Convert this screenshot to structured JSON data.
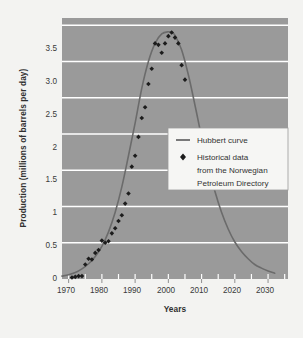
{
  "chart_data": {
    "type": "line",
    "title": "",
    "xlabel": "Years",
    "ylabel": "Production (millions of barrels per day)",
    "xlim": [
      1968,
      2036
    ],
    "ylim": [
      0,
      3.6
    ],
    "grid": true,
    "grid_color": "#ffffff",
    "plot_background": "#9a9a9a",
    "legend_position": "center-right",
    "xticks": [
      "1970",
      "1980",
      "1990",
      "2000",
      "2010",
      "2020",
      "2030"
    ],
    "xtick_values": [
      1970,
      1980,
      1990,
      2000,
      2010,
      2020,
      2030
    ],
    "xminor_step": 5,
    "yticks": [
      "0",
      "0.5",
      "1",
      "1.5",
      "2",
      "2.5",
      "3.0",
      "3.5"
    ],
    "ytick_values": [
      0,
      0.5,
      1,
      1.5,
      2,
      2.5,
      3.0,
      3.5
    ],
    "series": [
      {
        "name": "Hubbert curve",
        "type": "line",
        "color": "#6b6b6b",
        "x": [
          1968,
          1970,
          1972,
          1974,
          1976,
          1978,
          1980,
          1982,
          1984,
          1986,
          1988,
          1990,
          1992,
          1994,
          1996,
          1998,
          2000,
          2001,
          2002,
          2004,
          2006,
          2008,
          2010,
          2012,
          2014,
          2016,
          2018,
          2020,
          2022,
          2024,
          2026,
          2028,
          2030,
          2032
        ],
        "values": [
          0.04,
          0.06,
          0.09,
          0.14,
          0.21,
          0.31,
          0.45,
          0.65,
          0.92,
          1.27,
          1.7,
          2.15,
          2.63,
          3.0,
          3.25,
          3.38,
          3.41,
          3.4,
          3.36,
          3.16,
          2.82,
          2.4,
          1.96,
          1.56,
          1.21,
          0.92,
          0.69,
          0.51,
          0.38,
          0.28,
          0.2,
          0.15,
          0.11,
          0.08
        ]
      },
      {
        "name": "Historical data from the Norwegian Petroleum Directory",
        "type": "scatter",
        "color": "#1c1c1c",
        "marker": "diamond",
        "x": [
          1971,
          1972,
          1973,
          1974,
          1975,
          1976,
          1977,
          1978,
          1979,
          1980,
          1981,
          1982,
          1983,
          1984,
          1985,
          1986,
          1987,
          1988,
          1989,
          1990,
          1991,
          1992,
          1993,
          1994,
          1995,
          1996,
          1997,
          1998,
          1999,
          2000,
          2001,
          2002,
          2003,
          2004,
          2005
        ],
        "values": [
          0.02,
          0.03,
          0.04,
          0.04,
          0.2,
          0.28,
          0.27,
          0.36,
          0.4,
          0.53,
          0.5,
          0.52,
          0.63,
          0.7,
          0.8,
          0.88,
          1.04,
          1.18,
          1.55,
          1.7,
          1.96,
          2.22,
          2.37,
          2.69,
          2.9,
          3.25,
          3.23,
          3.12,
          3.25,
          3.35,
          3.4,
          3.33,
          3.25,
          2.95,
          2.75
        ]
      }
    ],
    "legend": {
      "entries": [
        {
          "label": "Hubbert curve",
          "marker": "line",
          "color": "#6b6b6b"
        },
        {
          "label": "Historical data",
          "marker": "diamond",
          "color": "#1c1c1c"
        },
        {
          "label": "from the Norwegian",
          "marker": "none",
          "color": "#1c1c1c"
        },
        {
          "label": "Petroleum Directory",
          "marker": "none",
          "color": "#1c1c1c"
        }
      ]
    }
  },
  "labels": {
    "y_axis_title": "Production (millions of barrels per day)",
    "x_axis_title": "Years",
    "ytick_0": "0",
    "ytick_1": "0.5",
    "ytick_2": "1",
    "ytick_3": "1.5",
    "ytick_4": "2",
    "ytick_5": "2.5",
    "ytick_6": "3.0",
    "ytick_7": "3.5",
    "xtick_0": "1970",
    "xtick_1": "1980",
    "xtick_2": "1990",
    "xtick_3": "2000",
    "xtick_4": "2010",
    "xtick_5": "2020",
    "xtick_6": "2030",
    "legend_line_label": "Hubbert curve",
    "legend_point_label_1": "Historical data",
    "legend_point_label_2": "from the Norwegian",
    "legend_point_label_3": "Petroleum Directory"
  }
}
